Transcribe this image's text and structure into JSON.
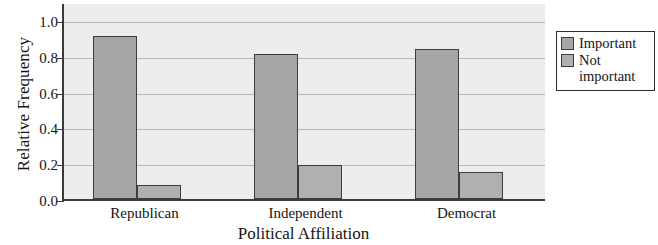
{
  "chart_data": {
    "type": "bar",
    "title": "",
    "xlabel": "Political Affiliation",
    "ylabel": "Relative Frequency",
    "categories": [
      "Republican",
      "Independent",
      "Democrat"
    ],
    "series": [
      {
        "name": "Important",
        "values": [
          0.91,
          0.81,
          0.84
        ],
        "color": "#a6a6a6"
      },
      {
        "name": "Not important",
        "values": [
          0.08,
          0.19,
          0.15
        ],
        "color": "#b0b0b0"
      }
    ],
    "ylim": [
      0.0,
      1.0
    ],
    "yticks": [
      "0.0",
      "0.2",
      "0.4",
      "0.6",
      "0.8",
      "1.0"
    ],
    "ytick_values": [
      0.0,
      0.2,
      0.4,
      0.6,
      0.8,
      1.0
    ],
    "grid": true,
    "legend_position": "right",
    "plot_background": "#ededed",
    "gridline_color": "#b9b9b9",
    "axis_color": "#3a3a3a"
  },
  "legend": {
    "entries": [
      {
        "label": "Important"
      },
      {
        "label": "Not important"
      }
    ]
  }
}
